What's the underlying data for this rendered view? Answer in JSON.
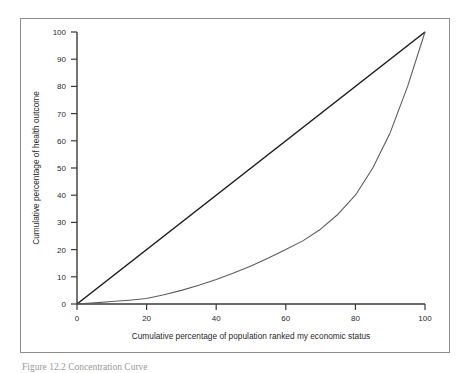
{
  "figure": {
    "caption": "Figure 12.2  Concentration Curve",
    "frame_color": "#8c8c8c"
  },
  "chart_data": {
    "type": "line",
    "title": "",
    "xlabel": "Cumulative percentage of population ranked my economic status",
    "ylabel": "Cumulative percentage of health outcome",
    "xlim": [
      0,
      100
    ],
    "ylim": [
      0,
      100
    ],
    "grid": false,
    "legend_position": "none",
    "xticks": [
      0,
      20,
      40,
      60,
      80,
      100
    ],
    "yticks": [
      0,
      10,
      20,
      30,
      40,
      50,
      60,
      70,
      80,
      90,
      100
    ],
    "xtick_labels": [
      "0",
      "20",
      "40",
      "60",
      "80",
      "100"
    ],
    "ytick_labels": [
      "0",
      "10",
      "20",
      "30",
      "40",
      "50",
      "60",
      "70",
      "80",
      "90",
      "100"
    ],
    "series": [
      {
        "name": "Line of equality",
        "color": "#1a1a1a",
        "x": [
          0,
          100
        ],
        "values": [
          0,
          100
        ]
      },
      {
        "name": "Concentration curve",
        "color": "#5d5d5d",
        "x": [
          0,
          5,
          10,
          15,
          20,
          25,
          30,
          35,
          40,
          45,
          50,
          55,
          60,
          65,
          70,
          75,
          80,
          85,
          90,
          95,
          100
        ],
        "values": [
          0,
          0.4,
          0.9,
          1.4,
          2.0,
          3.4,
          5.0,
          6.9,
          9.0,
          11.4,
          14.0,
          16.9,
          20.0,
          23.3,
          27.5,
          33.0,
          40.0,
          50.0,
          63.0,
          80.0,
          100.0
        ]
      }
    ]
  }
}
